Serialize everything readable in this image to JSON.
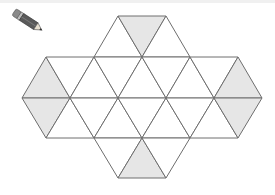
{
  "figure": {
    "pencil_icon": "pencil-icon",
    "colors": {
      "line": "#6e6e6e",
      "shade": "#e6e6e6",
      "background": "#ffffff"
    },
    "triangles": [
      {
        "pts": "94,57 118,16 142,57",
        "shaded": false
      },
      {
        "pts": "118,16 166,16 142,57",
        "shaded": true
      },
      {
        "pts": "142,57 166,16 190,57",
        "shaded": false
      },
      {
        "pts": "22,98 46,57 70,98",
        "shaded": true
      },
      {
        "pts": "46,57 94,57 70,98",
        "shaded": false
      },
      {
        "pts": "70,98 94,57 118,98",
        "shaded": false
      },
      {
        "pts": "94,57 142,57 118,98",
        "shaded": false
      },
      {
        "pts": "118,98 142,57 166,98",
        "shaded": false
      },
      {
        "pts": "142,57 190,57 166,98",
        "shaded": false
      },
      {
        "pts": "166,98 190,57 214,98",
        "shaded": false
      },
      {
        "pts": "190,57 238,57 214,98",
        "shaded": false
      },
      {
        "pts": "214,98 238,57 262,98",
        "shaded": true
      },
      {
        "pts": "22,98 70,98 46,138",
        "shaded": true
      },
      {
        "pts": "46,138 70,98 94,138",
        "shaded": false
      },
      {
        "pts": "70,98 118,98 94,138",
        "shaded": false
      },
      {
        "pts": "94,138 118,98 142,138",
        "shaded": false
      },
      {
        "pts": "118,98 166,98 142,138",
        "shaded": false
      },
      {
        "pts": "142,138 166,98 190,138",
        "shaded": false
      },
      {
        "pts": "166,98 214,98 190,138",
        "shaded": false
      },
      {
        "pts": "190,138 214,98 238,138",
        "shaded": false
      },
      {
        "pts": "214,98 262,98 238,138",
        "shaded": true
      },
      {
        "pts": "94,138 142,138 118,178",
        "shaded": false
      },
      {
        "pts": "118,178 142,138 166,178",
        "shaded": true
      },
      {
        "pts": "142,138 190,138 166,178",
        "shaded": false
      }
    ]
  }
}
